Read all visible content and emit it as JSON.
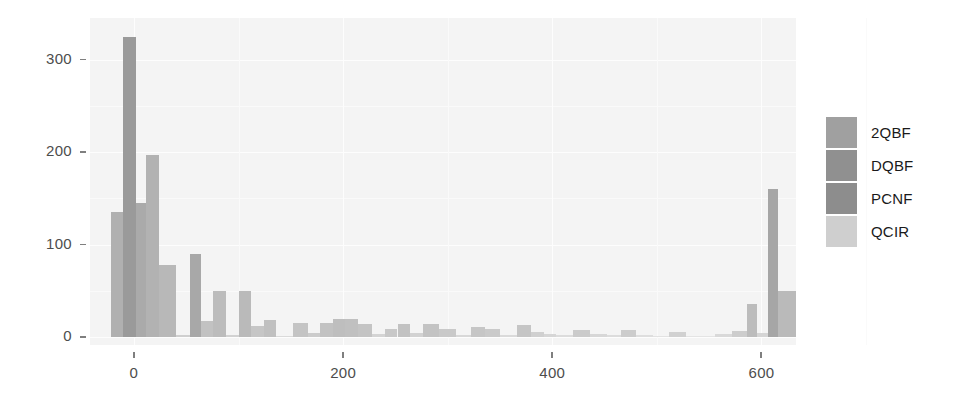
{
  "chart_data": {
    "type": "bar",
    "title": "",
    "xlabel": "",
    "ylabel": "",
    "xlim": [
      -42,
      633
    ],
    "ylim": [
      0,
      345
    ],
    "xticks": [
      0,
      200,
      400,
      600
    ],
    "yticks": [
      0,
      100,
      200,
      300
    ],
    "xtick_labels": [
      "0",
      "200",
      "400",
      "600"
    ],
    "ytick_labels": [
      "0",
      "100",
      "200",
      "300"
    ],
    "grid": true,
    "legend_position": "right",
    "bin_width": 20,
    "note": "Overlapping histogram of four formats; bars are drawn semi-transparent grey so overlaps read darker.",
    "series": [
      {
        "name": "2QBF",
        "color": "#9e9e9e"
      },
      {
        "name": "DQBF",
        "color": "#8a8a8a"
      },
      {
        "name": "PCNF",
        "color": "#8f8f8f"
      },
      {
        "name": "QCIR",
        "color": "#c9c9c9"
      }
    ],
    "bars": [
      {
        "x0": -42,
        "x1": -22,
        "value": 0,
        "shade": "#bdbdbd"
      },
      {
        "x0": -22,
        "x1": -10,
        "value": 135,
        "shade": "#b0b0b0"
      },
      {
        "x0": -10,
        "x1": 2,
        "value": 325,
        "shade": "#9a9a9a"
      },
      {
        "x0": 2,
        "x1": 12,
        "value": 145,
        "shade": "#aaaaaa"
      },
      {
        "x0": 12,
        "x1": 24,
        "value": 197,
        "shade": "#b2b2b2"
      },
      {
        "x0": 24,
        "x1": 40,
        "value": 78,
        "shade": "#b8b8b8"
      },
      {
        "x0": 40,
        "x1": 54,
        "value": 2,
        "shade": "#cfcfcf"
      },
      {
        "x0": 54,
        "x1": 64,
        "value": 90,
        "shade": "#a8a8a8"
      },
      {
        "x0": 64,
        "x1": 76,
        "value": 17,
        "shade": "#c2c2c2"
      },
      {
        "x0": 76,
        "x1": 88,
        "value": 50,
        "shade": "#bcbcbc"
      },
      {
        "x0": 88,
        "x1": 100,
        "value": 2,
        "shade": "#d2d2d2"
      },
      {
        "x0": 100,
        "x1": 112,
        "value": 50,
        "shade": "#bababa"
      },
      {
        "x0": 112,
        "x1": 124,
        "value": 12,
        "shade": "#c6c6c6"
      },
      {
        "x0": 124,
        "x1": 136,
        "value": 18,
        "shade": "#c0c0c0"
      },
      {
        "x0": 136,
        "x1": 152,
        "value": 1,
        "shade": "#dadada"
      },
      {
        "x0": 152,
        "x1": 166,
        "value": 15,
        "shade": "#c4c4c4"
      },
      {
        "x0": 166,
        "x1": 178,
        "value": 4,
        "shade": "#cccccc"
      },
      {
        "x0": 178,
        "x1": 190,
        "value": 15,
        "shade": "#c2c2c2"
      },
      {
        "x0": 190,
        "x1": 202,
        "value": 20,
        "shade": "#bebebe"
      },
      {
        "x0": 202,
        "x1": 214,
        "value": 19,
        "shade": "#c0c0c0"
      },
      {
        "x0": 214,
        "x1": 228,
        "value": 14,
        "shade": "#c4c4c4"
      },
      {
        "x0": 228,
        "x1": 240,
        "value": 3,
        "shade": "#d4d4d4"
      },
      {
        "x0": 240,
        "x1": 252,
        "value": 9,
        "shade": "#c8c8c8"
      },
      {
        "x0": 252,
        "x1": 264,
        "value": 14,
        "shade": "#c2c2c2"
      },
      {
        "x0": 264,
        "x1": 276,
        "value": 4,
        "shade": "#d2d2d2"
      },
      {
        "x0": 276,
        "x1": 292,
        "value": 14,
        "shade": "#c3c3c3"
      },
      {
        "x0": 292,
        "x1": 308,
        "value": 9,
        "shade": "#c9c9c9"
      },
      {
        "x0": 308,
        "x1": 322,
        "value": 2,
        "shade": "#d8d8d8"
      },
      {
        "x0": 322,
        "x1": 336,
        "value": 11,
        "shade": "#c6c6c6"
      },
      {
        "x0": 336,
        "x1": 350,
        "value": 9,
        "shade": "#cacaca"
      },
      {
        "x0": 350,
        "x1": 366,
        "value": 2,
        "shade": "#dadada"
      },
      {
        "x0": 366,
        "x1": 380,
        "value": 13,
        "shade": "#c5c5c5"
      },
      {
        "x0": 380,
        "x1": 392,
        "value": 5,
        "shade": "#d0d0d0"
      },
      {
        "x0": 392,
        "x1": 404,
        "value": 3,
        "shade": "#d6d6d6"
      },
      {
        "x0": 404,
        "x1": 420,
        "value": 2,
        "shade": "#dcdcdc"
      },
      {
        "x0": 420,
        "x1": 436,
        "value": 8,
        "shade": "#cbcbcb"
      },
      {
        "x0": 436,
        "x1": 452,
        "value": 3,
        "shade": "#d7d7d7"
      },
      {
        "x0": 452,
        "x1": 466,
        "value": 2,
        "shade": "#dcdcdc"
      },
      {
        "x0": 466,
        "x1": 480,
        "value": 8,
        "shade": "#cccccc"
      },
      {
        "x0": 480,
        "x1": 496,
        "value": 2,
        "shade": "#dedede"
      },
      {
        "x0": 496,
        "x1": 512,
        "value": 1,
        "shade": "#e2e2e2"
      },
      {
        "x0": 512,
        "x1": 528,
        "value": 5,
        "shade": "#d1d1d1"
      },
      {
        "x0": 528,
        "x1": 556,
        "value": 1,
        "shade": "#e4e4e4"
      },
      {
        "x0": 556,
        "x1": 572,
        "value": 3,
        "shade": "#d9d9d9"
      },
      {
        "x0": 572,
        "x1": 586,
        "value": 6,
        "shade": "#cdcdcd"
      },
      {
        "x0": 586,
        "x1": 596,
        "value": 36,
        "shade": "#bcbcbc"
      },
      {
        "x0": 596,
        "x1": 606,
        "value": 4,
        "shade": "#d5d5d5"
      },
      {
        "x0": 606,
        "x1": 616,
        "value": 160,
        "shade": "#a6a6a6"
      },
      {
        "x0": 616,
        "x1": 633,
        "value": 50,
        "shade": "#bababa"
      }
    ]
  },
  "legend": {
    "items": [
      {
        "label": "2QBF",
        "color": "#a0a0a0"
      },
      {
        "label": "DQBF",
        "color": "#909090"
      },
      {
        "label": "PCNF",
        "color": "#8d8d8d"
      },
      {
        "label": "QCIR",
        "color": "#cfcfcf"
      }
    ]
  },
  "colors": {
    "panel_background": "#f4f4f4",
    "gridline": "#fdfdfd",
    "axis_text": "#4d4d4d",
    "legend_text": "#1a1a1a",
    "tick_mark": "#7f7f7f"
  }
}
